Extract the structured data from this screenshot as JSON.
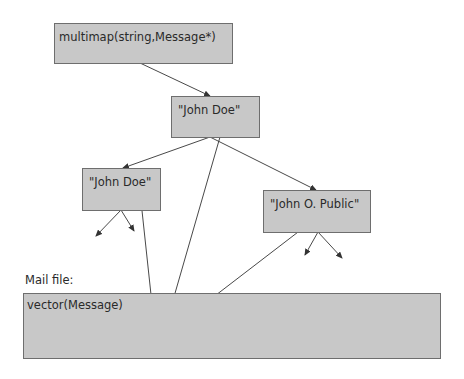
{
  "diagram": {
    "nodes": [
      {
        "id": "multimap",
        "label": "multimap(string,Message*)",
        "x": 54,
        "y": 23,
        "w": 179,
        "h": 41
      },
      {
        "id": "john-doe-root",
        "label": "\"John Doe\"",
        "x": 171,
        "y": 96,
        "w": 89,
        "h": 42
      },
      {
        "id": "john-doe-left",
        "label": "\"John Doe\"",
        "x": 82,
        "y": 168,
        "w": 79,
        "h": 43
      },
      {
        "id": "john-o-public",
        "label": "\"John O. Public\"",
        "x": 263,
        "y": 190,
        "w": 108,
        "h": 43
      },
      {
        "id": "vector",
        "label": "vector(Message)",
        "x": 23,
        "y": 293,
        "w": 418,
        "h": 66
      }
    ],
    "mail_file_label": "Mail file:",
    "edges": [
      {
        "from": "multimap",
        "to": "john-doe-root",
        "x1": 140,
        "y1": 63,
        "x2": 210,
        "y2": 96
      },
      {
        "from": "john-doe-root",
        "to": "john-doe-left",
        "x1": 210,
        "y1": 137,
        "x2": 123,
        "y2": 168
      },
      {
        "from": "john-doe-root",
        "to": "john-o-public",
        "x1": 210,
        "y1": 137,
        "x2": 316,
        "y2": 190
      },
      {
        "from": "john-doe-root",
        "to": "vector",
        "x1": 220,
        "y1": 137,
        "x2": 165,
        "y2": 328
      },
      {
        "from": "john-doe-left",
        "to": "child-left",
        "x1": 121,
        "y1": 210,
        "x2": 96,
        "y2": 236
      },
      {
        "from": "john-doe-left",
        "to": "child-right",
        "x1": 121,
        "y1": 210,
        "x2": 134,
        "y2": 231
      },
      {
        "from": "john-doe-left",
        "to": "vector",
        "x1": 140,
        "y1": 192,
        "x2": 152,
        "y2": 304
      },
      {
        "from": "john-o-public",
        "to": "child-left",
        "x1": 318,
        "y1": 232,
        "x2": 305,
        "y2": 255
      },
      {
        "from": "john-o-public",
        "to": "child-right",
        "x1": 318,
        "y1": 232,
        "x2": 342,
        "y2": 258
      },
      {
        "from": "john-o-public",
        "to": "vector",
        "x1": 315,
        "y1": 219,
        "x2": 203,
        "y2": 305
      }
    ],
    "colors": {
      "box_fill": "#c8c8c8",
      "box_border": "#6e6e6e",
      "line": "#333333",
      "text": "#2a2a2a"
    }
  }
}
